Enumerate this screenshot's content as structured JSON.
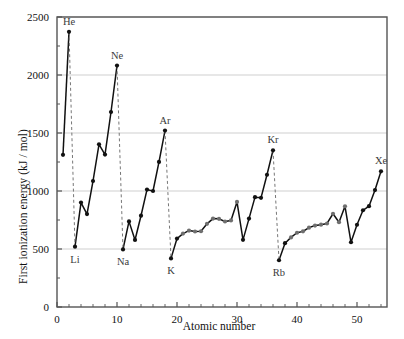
{
  "chart_data": {
    "type": "line",
    "title": "",
    "xlabel": "Atomic number",
    "ylabel": "First ionization energy (kJ / mol)",
    "xlim": [
      0,
      55
    ],
    "ylim": [
      0,
      2500
    ],
    "xticks": [
      0,
      10,
      20,
      30,
      40,
      50
    ],
    "xticklabels": [
      "0",
      "10",
      "20",
      "30",
      "40",
      "50"
    ],
    "yticks": [
      0,
      500,
      1000,
      1500,
      2000,
      2500
    ],
    "yticklabels": [
      "0",
      "500",
      "1000",
      "1500",
      "2000",
      "2500"
    ],
    "grid": "horizontal",
    "legend": "none",
    "marker": "filled-circle",
    "line_style": "solid",
    "x": [
      1,
      2,
      3,
      4,
      5,
      6,
      7,
      8,
      9,
      10,
      11,
      12,
      13,
      14,
      15,
      16,
      17,
      18,
      19,
      20,
      21,
      22,
      23,
      24,
      25,
      26,
      27,
      28,
      29,
      30,
      31,
      32,
      33,
      34,
      35,
      36,
      37,
      38,
      39,
      40,
      41,
      42,
      43,
      44,
      45,
      46,
      47,
      48,
      49,
      50,
      51,
      52,
      53,
      54
    ],
    "values": [
      1312,
      2372,
      520,
      900,
      801,
      1086,
      1402,
      1314,
      1681,
      2081,
      496,
      738,
      578,
      787,
      1012,
      1000,
      1251,
      1521,
      419,
      590,
      633,
      659,
      651,
      653,
      717,
      762,
      760,
      737,
      746,
      906,
      579,
      762,
      947,
      941,
      1140,
      1351,
      403,
      550,
      600,
      640,
      652,
      684,
      702,
      710,
      720,
      804,
      731,
      868,
      558,
      709,
      834,
      869,
      1008,
      1170
    ],
    "series_name": "First ionization energy",
    "annotations": [
      {
        "label": "He",
        "x": 2,
        "y": 2372
      },
      {
        "label": "Ne",
        "x": 10,
        "y": 2081
      },
      {
        "label": "Ar",
        "x": 18,
        "y": 1521
      },
      {
        "label": "Kr",
        "x": 36,
        "y": 1351
      },
      {
        "label": "Xe",
        "x": 54,
        "y": 1170
      },
      {
        "label": "Li",
        "x": 3,
        "y": 520
      },
      {
        "label": "Na",
        "x": 11,
        "y": 496
      },
      {
        "label": "K",
        "x": 19,
        "y": 419
      },
      {
        "label": "Rb",
        "x": 37,
        "y": 403
      }
    ],
    "dashed_drop_lines": [
      {
        "from_x": 2,
        "to_x": 3
      },
      {
        "from_x": 10,
        "to_x": 11
      },
      {
        "from_x": 18,
        "to_x": 19
      },
      {
        "from_x": 36,
        "to_x": 37
      }
    ],
    "colors": {
      "line": "#111111",
      "marker": "#111111",
      "marker_transition": "#6f6f6f",
      "grid": "#cfcfcf",
      "axis": "#555555",
      "dashed": "#777777",
      "background": "#ffffff",
      "text": "#111111",
      "annotation_text": "#3a3a3a"
    }
  },
  "axis": {
    "x_title": "Atomic number",
    "y_title": "First ionization energy (kJ / mol)"
  }
}
